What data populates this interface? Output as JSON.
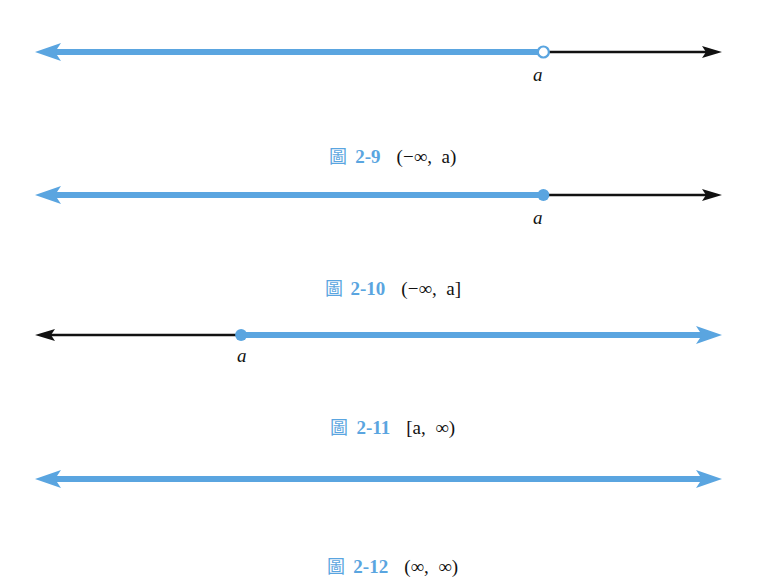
{
  "colors": {
    "highlight": "#5aa5e0",
    "axis": "#111111"
  },
  "figures": [
    {
      "fig_char": "圖",
      "fig_number": "2-9",
      "interval": "(−∞,  a)",
      "point_label": "a",
      "endpoint": "open",
      "shaded": "left",
      "point_pos": 0.74
    },
    {
      "fig_char": "圖",
      "fig_number": "2-10",
      "interval": "(−∞,  a]",
      "point_label": "a",
      "endpoint": "closed",
      "shaded": "left",
      "point_pos": 0.74
    },
    {
      "fig_char": "圖",
      "fig_number": "2-11",
      "interval": "[a,  ∞)",
      "point_label": "a",
      "endpoint": "closed",
      "shaded": "right",
      "point_pos": 0.3
    },
    {
      "fig_char": "圖",
      "fig_number": "2-12",
      "interval": "(∞,  ∞)",
      "point_label": "",
      "endpoint": "none",
      "shaded": "all",
      "point_pos": null
    }
  ]
}
